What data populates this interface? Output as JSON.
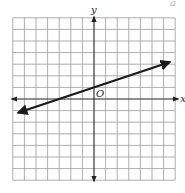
{
  "graph": {
    "grid": {
      "x_min": -7,
      "x_max": 7,
      "y_min": -7,
      "y_max": 7,
      "step": 1,
      "origin_px": [
        94,
        99
      ],
      "cell_px": 11.6
    },
    "axes": {
      "x_label": "x",
      "y_label": "y",
      "origin_label": "O",
      "arrows": true
    },
    "line": {
      "slope": 0.3333,
      "intercept": 1,
      "x_start": -6.5,
      "x_end": 6.5,
      "arrows_both_ends": true
    },
    "corner_glyph": "a",
    "colors": {
      "grid": "#9a9a9a",
      "axis": "#222222",
      "line": "#1a1a1a",
      "background": "#ffffff"
    }
  },
  "chart_data": {
    "type": "line",
    "title": "",
    "xlabel": "x",
    "ylabel": "y",
    "xlim": [
      -7,
      7
    ],
    "ylim": [
      -7,
      7
    ],
    "grid": true,
    "series": [
      {
        "name": "line",
        "equation": "y = (1/3)x + 1",
        "x": [
          -6.5,
          -3,
          0,
          3,
          6.5
        ],
        "y": [
          -1.17,
          0,
          1,
          2,
          3.17
        ]
      }
    ],
    "annotations": [
      "O"
    ]
  }
}
